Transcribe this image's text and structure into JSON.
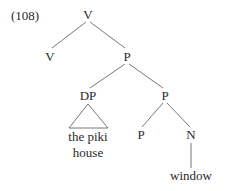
{
  "example_number": "(108)",
  "nodes": {
    "root": "V",
    "v_left": "V",
    "p_top": "P",
    "dp": "DP",
    "p_mid": "P",
    "p_low": "P",
    "n": "N"
  },
  "leaves": {
    "dp_line1": "the piki",
    "dp_line2": "house",
    "n_leaf": "window"
  },
  "colors": {
    "line": "#555555",
    "text": "#2a2a2a"
  }
}
